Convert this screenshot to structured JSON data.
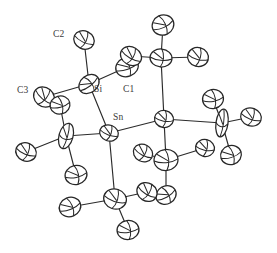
{
  "figure": {
    "kind": "ortep-thermal-ellipsoid-plot",
    "background_color": "#ffffff",
    "line_color": "#2b2b2b",
    "label_color": "#3a3a3a",
    "width": 277,
    "height": 253
  },
  "labels": [
    {
      "id": "C2",
      "text": "C2",
      "x": 53,
      "y": 37
    },
    {
      "id": "C3",
      "text": "C3",
      "x": 17,
      "y": 93
    },
    {
      "id": "Si",
      "text": "Si",
      "x": 94,
      "y": 92
    },
    {
      "id": "C1",
      "text": "C1",
      "x": 123,
      "y": 92
    },
    {
      "id": "Sn",
      "text": "Sn",
      "x": 113,
      "y": 120
    }
  ],
  "chart_data": {
    "type": "scatter",
    "xlabel": "",
    "ylabel": "",
    "annotations": [
      "C2",
      "C3",
      "Si",
      "C1",
      "Sn"
    ],
    "atoms": [
      {
        "id": "Si",
        "label": "Si",
        "x": 89,
        "y": 84,
        "rx": 11,
        "ry": 8.5,
        "rot": -38
      },
      {
        "id": "Sn",
        "label": "Sn",
        "x": 109,
        "y": 133,
        "rx": 9.5,
        "ry": 8,
        "rot": 20
      },
      {
        "id": "Sn2",
        "label": "",
        "x": 164,
        "y": 119,
        "rx": 9.5,
        "ry": 8.5,
        "rot": 10
      },
      {
        "id": "C2a",
        "label": "C2",
        "x": 84,
        "y": 40,
        "rx": 10.5,
        "ry": 9,
        "rot": 25
      },
      {
        "id": "C3a",
        "label": "C3",
        "x": 44,
        "y": 97,
        "rx": 11,
        "ry": 9.5,
        "rot": 40
      },
      {
        "id": "C3b",
        "label": "",
        "x": 60,
        "y": 105,
        "rx": 10,
        "ry": 9,
        "rot": -15
      },
      {
        "id": "C1a",
        "label": "C1",
        "x": 127,
        "y": 67,
        "rx": 11.5,
        "ry": 9.5,
        "rot": -20
      },
      {
        "id": "C1b",
        "label": "",
        "x": 131,
        "y": 56,
        "rx": 11,
        "ry": 9,
        "rot": 30
      },
      {
        "id": "A1",
        "label": "",
        "x": 161,
        "y": 58,
        "rx": 11,
        "ry": 9,
        "rot": 5
      },
      {
        "id": "A2",
        "label": "",
        "x": 163,
        "y": 25,
        "rx": 11,
        "ry": 10,
        "rot": -25
      },
      {
        "id": "A3",
        "label": "",
        "x": 198,
        "y": 57,
        "rx": 10.5,
        "ry": 9.5,
        "rot": 15
      },
      {
        "id": "A4",
        "label": "",
        "x": 213,
        "y": 99,
        "rx": 10.5,
        "ry": 9.5,
        "rot": -10
      },
      {
        "id": "A5",
        "label": "",
        "x": 222,
        "y": 123,
        "rx": 6,
        "ry": 14,
        "rot": 8
      },
      {
        "id": "A6",
        "label": "",
        "x": 251,
        "y": 117,
        "rx": 10.5,
        "ry": 9,
        "rot": 20
      },
      {
        "id": "A7",
        "label": "",
        "x": 231,
        "y": 155,
        "rx": 10.5,
        "ry": 9.5,
        "rot": -18
      },
      {
        "id": "A8",
        "label": "",
        "x": 205,
        "y": 148,
        "rx": 9.5,
        "ry": 8.5,
        "rot": 12
      },
      {
        "id": "A9",
        "label": "",
        "x": 166,
        "y": 160,
        "rx": 12,
        "ry": 10.5,
        "rot": -5
      },
      {
        "id": "A10",
        "label": "",
        "x": 143,
        "y": 153,
        "rx": 10,
        "ry": 8.5,
        "rot": 28
      },
      {
        "id": "A11",
        "label": "",
        "x": 166,
        "y": 195,
        "rx": 10.5,
        "ry": 9,
        "rot": -30
      },
      {
        "id": "A12",
        "label": "",
        "x": 66,
        "y": 136,
        "rx": 7,
        "ry": 13,
        "rot": 15
      },
      {
        "id": "A13",
        "label": "",
        "x": 26,
        "y": 152,
        "rx": 10.5,
        "ry": 9,
        "rot": 22
      },
      {
        "id": "A14",
        "label": "",
        "x": 76,
        "y": 175,
        "rx": 11,
        "ry": 9.5,
        "rot": -12
      },
      {
        "id": "A15",
        "label": "",
        "x": 115,
        "y": 199,
        "rx": 11.5,
        "ry": 10,
        "rot": 18
      },
      {
        "id": "A16",
        "label": "",
        "x": 70,
        "y": 207,
        "rx": 11,
        "ry": 9.5,
        "rot": -22
      },
      {
        "id": "A17",
        "label": "",
        "x": 147,
        "y": 192,
        "rx": 10.5,
        "ry": 9,
        "rot": 32
      },
      {
        "id": "A18",
        "label": "",
        "x": 128,
        "y": 230,
        "rx": 11,
        "ry": 9.5,
        "rot": -8
      }
    ],
    "bonds": [
      {
        "from": "Si",
        "to": "C2a"
      },
      {
        "from": "Si",
        "to": "C3a"
      },
      {
        "from": "Si",
        "to": "C1a"
      },
      {
        "from": "Si",
        "to": "Sn"
      },
      {
        "from": "Sn",
        "to": "Sn2"
      },
      {
        "from": "Sn",
        "to": "A12"
      },
      {
        "from": "Sn",
        "to": "A15"
      },
      {
        "from": "Sn2",
        "to": "A1"
      },
      {
        "from": "Sn2",
        "to": "A5"
      },
      {
        "from": "Sn2",
        "to": "A9"
      },
      {
        "from": "A1",
        "to": "A2"
      },
      {
        "from": "A1",
        "to": "A3"
      },
      {
        "from": "A1",
        "to": "C1b"
      },
      {
        "from": "A5",
        "to": "A4"
      },
      {
        "from": "A5",
        "to": "A6"
      },
      {
        "from": "A5",
        "to": "A7"
      },
      {
        "from": "A9",
        "to": "A8"
      },
      {
        "from": "A9",
        "to": "A10"
      },
      {
        "from": "A9",
        "to": "A11"
      },
      {
        "from": "A12",
        "to": "A13"
      },
      {
        "from": "A12",
        "to": "A14"
      },
      {
        "from": "A12",
        "to": "C3b"
      },
      {
        "from": "A15",
        "to": "A16"
      },
      {
        "from": "A15",
        "to": "A17"
      },
      {
        "from": "A15",
        "to": "A18"
      }
    ]
  }
}
